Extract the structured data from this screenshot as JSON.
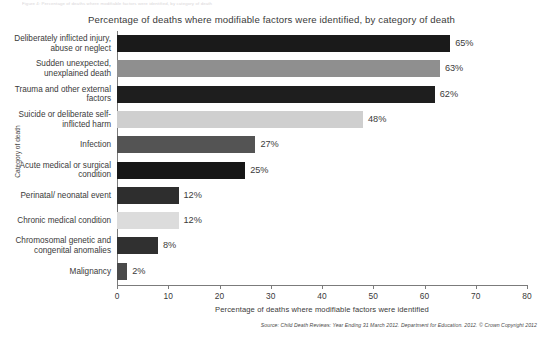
{
  "top_clip_text": "Figure 4: Percentage of deaths where modifiable factors were identified, by category of death",
  "chart_data": {
    "type": "bar",
    "orientation": "horizontal",
    "title": "Percentage of deaths where modifiable factors were identified, by category of death",
    "xlabel": "Percentage of deaths where modifiable factors were identified",
    "ylabel": "Category of death",
    "xlim": [
      0,
      80
    ],
    "xticks": [
      0,
      10,
      20,
      30,
      40,
      50,
      60,
      70,
      80
    ],
    "grid": false,
    "legend": "none",
    "value_suffix": "%",
    "categories": [
      "Deliberately inflicted injury, abuse or neglect",
      "Sudden unexpected, unexplained death",
      "Trauma and other external factors",
      "Suicide or deliberate self-inflicted harm",
      "Infection",
      "Acute medical or surgical condition",
      "Perinatal/ neonatal event",
      "Chronic medical condition",
      "Chromosomal genetic and congenital anomalies",
      "Malignancy"
    ],
    "values": [
      65,
      63,
      62,
      48,
      27,
      25,
      12,
      12,
      8,
      2
    ],
    "value_labels": [
      "65%",
      "63%",
      "62%",
      "48%",
      "27%",
      "25%",
      "12%",
      "12%",
      "8%",
      "2%"
    ],
    "bar_colors": [
      "#1a1a1a",
      "#8f8f8f",
      "#1e1e1e",
      "#cfcfcf",
      "#545454",
      "#161616",
      "#2e2e2e",
      "#dcdcdc",
      "#303030",
      "#4a4a4a"
    ]
  },
  "source": "Source: Child Death Reviews: Year Ending 31 March 2012. Department for Education. 2012. © Crown Copyright 2012",
  "colors": {
    "axis": "#7b7b7b",
    "text": "#3a3a3a",
    "background": "#ffffff"
  }
}
